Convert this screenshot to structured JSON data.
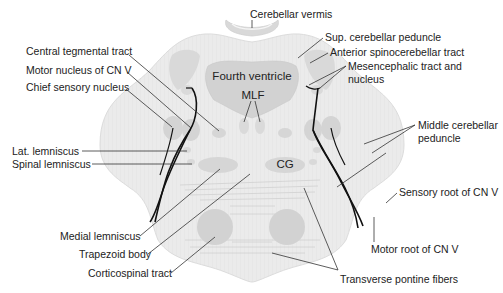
{
  "diagram": {
    "colors": {
      "background": "#ffffff",
      "pons_fill": "#ebebeb",
      "structure_fill": "#d6d6d6",
      "ventricle_fill": "#d2d2d2",
      "nerve_stroke": "#111111",
      "leader_stroke": "#333333",
      "text": "#222222"
    },
    "inner_labels": {
      "fourth_ventricle": "Fourth ventricle",
      "mlf": "MLF",
      "cg": "CG"
    },
    "labels_left": [
      {
        "id": "central-tegmental-tract",
        "text": "Central tegmental tract"
      },
      {
        "id": "motor-nucleus-cn-v",
        "text": "Motor nucleus of CN V"
      },
      {
        "id": "chief-sensory-nucleus",
        "text": "Chief sensory nucleus"
      },
      {
        "id": "lat-lemniscus",
        "text": "Lat. lemniscus"
      },
      {
        "id": "spinal-lemniscus",
        "text": "Spinal lemniscus"
      },
      {
        "id": "medial-lemniscus",
        "text": "Medial lemniscus"
      },
      {
        "id": "trapezoid-body",
        "text": "Trapezoid body"
      },
      {
        "id": "corticospinal-tract",
        "text": "Corticospinal tract"
      }
    ],
    "labels_top": [
      {
        "id": "cerebellar-vermis",
        "text": "Cerebellar vermis"
      }
    ],
    "labels_right": [
      {
        "id": "sup-cerebellar-peduncle",
        "text": "Sup. cerebellar peduncle"
      },
      {
        "id": "anterior-spinocerebellar-tract",
        "text": "Anterior spinocerebellar tract"
      },
      {
        "id": "mesencephalic-tract-line1",
        "text": "Mesencephalic tract and"
      },
      {
        "id": "mesencephalic-tract-line2",
        "text": "nucleus"
      },
      {
        "id": "middle-cerebellar-peduncle-line1",
        "text": "Middle cerebellar"
      },
      {
        "id": "middle-cerebellar-peduncle-line2",
        "text": "peduncle"
      },
      {
        "id": "sensory-root-cn-v",
        "text": "Sensory root of CN V"
      },
      {
        "id": "motor-root-cn-v",
        "text": "Motor root of CN V"
      }
    ],
    "labels_bottom": [
      {
        "id": "transverse-pontine-fibers",
        "text": "Transverse pontine fibers"
      }
    ]
  }
}
